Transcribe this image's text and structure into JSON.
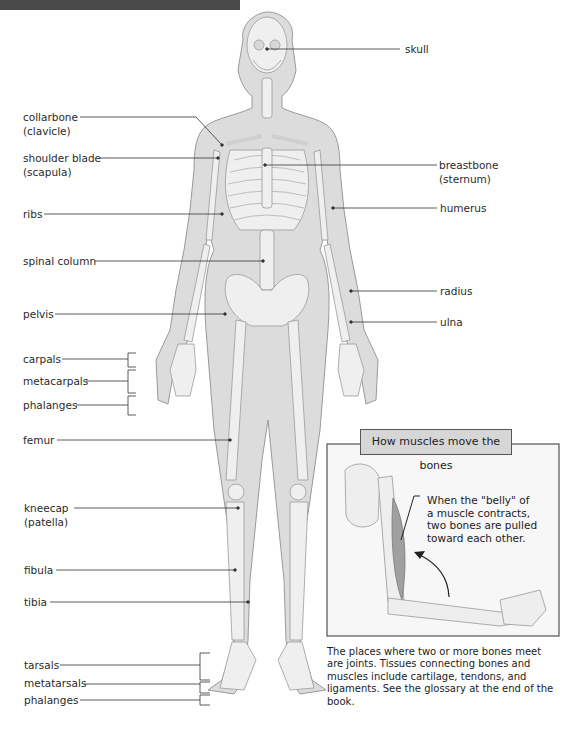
{
  "labels_left": {
    "collarbone": "collarbone",
    "collarbone_alt": "(clavicle)",
    "shoulder_blade": "shoulder blade",
    "shoulder_blade_alt": "(scapula)",
    "ribs": "ribs",
    "spinal_column": "spinal column",
    "pelvis": "pelvis",
    "carpals": "carpals",
    "metacarpals": "metacarpals",
    "hand_phalanges": "phalanges",
    "femur": "femur",
    "kneecap": "kneecap",
    "kneecap_alt": "(patella)",
    "fibula": "fibula",
    "tibia": "tibia",
    "tarsals": "tarsals",
    "metatarsals": "metatarsals",
    "foot_phalanges": "phalanges"
  },
  "labels_right": {
    "skull": "skull",
    "breastbone": "breastbone",
    "breastbone_alt": "(sternum)",
    "humerus": "humerus",
    "radius": "radius",
    "ulna": "ulna"
  },
  "inset": {
    "title": "How muscles move the bones",
    "note_lines": [
      "When the \"belly\" of",
      "a muscle contracts,",
      "two bones are pulled",
      "toward each other."
    ]
  },
  "caption": "The places where two or more bones meet are joints. Tissues connecting bones and muscles include cartilage, tendons, and ligaments. See the glossary at the end of the book.",
  "colors": {
    "body_fill": "#dcdcdc",
    "bone_fill": "#efefef",
    "outline": "#9a9a9a",
    "leader_line": "#333333",
    "topbar": "#4a4a4a"
  }
}
